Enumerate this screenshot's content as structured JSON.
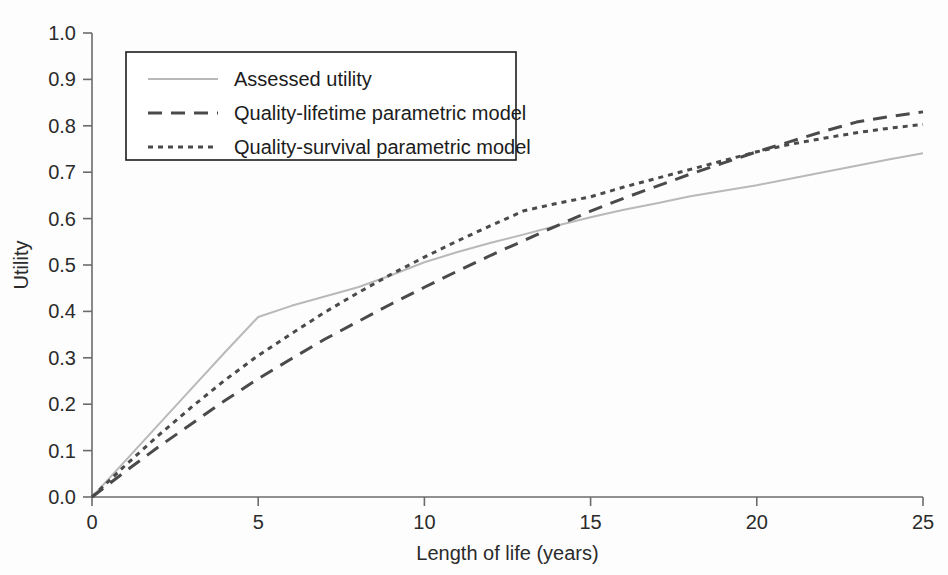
{
  "figure": {
    "background_color": "#fdfdfd"
  },
  "chart_data": {
    "type": "line",
    "title": "",
    "subtitle": "",
    "xlabel": "Length of life (years)",
    "ylabel": "Utility",
    "xlim": [
      0,
      25
    ],
    "ylim": [
      0.0,
      1.0
    ],
    "xticks": [
      0,
      5,
      10,
      15,
      20,
      25
    ],
    "xtick_labels": [
      "0",
      "5",
      "10",
      "15",
      "20",
      "25"
    ],
    "yticks": [
      0.0,
      0.1,
      0.2,
      0.3,
      0.4,
      0.5,
      0.6,
      0.7,
      0.8,
      0.9,
      1.0
    ],
    "ytick_labels": [
      "0.0",
      "0.1",
      "0.2",
      "0.3",
      "0.4",
      "0.5",
      "0.6",
      "0.7",
      "0.8",
      "0.9",
      "1.0"
    ],
    "grid": false,
    "legend_position": "upper-left",
    "series": [
      {
        "name": "Assessed utility",
        "style": "solid",
        "color": "#b9b9b9",
        "width": 2.0,
        "dash": "",
        "x": [
          0,
          1,
          2,
          3,
          4,
          5,
          6,
          7,
          8,
          9,
          10,
          11,
          12,
          13,
          14,
          15,
          16,
          17,
          18,
          19,
          20,
          21,
          22,
          23,
          24,
          25
        ],
        "y": [
          0.0,
          0.078,
          0.156,
          0.234,
          0.312,
          0.388,
          0.412,
          0.432,
          0.452,
          0.478,
          0.506,
          0.528,
          0.548,
          0.566,
          0.585,
          0.603,
          0.619,
          0.633,
          0.648,
          0.66,
          0.672,
          0.686,
          0.7,
          0.714,
          0.728,
          0.741
        ]
      },
      {
        "name": "Quality-lifetime parametric model",
        "style": "dashed",
        "color": "#4a4a4a",
        "width": 3.0,
        "dash": "14 9",
        "x": [
          0,
          1,
          2,
          3,
          4,
          5,
          6,
          7,
          8,
          9,
          10,
          11,
          12,
          13,
          14,
          15,
          16,
          17,
          18,
          19,
          20,
          21,
          22,
          23,
          24,
          25
        ],
        "y": [
          0.0,
          0.055,
          0.108,
          0.158,
          0.208,
          0.255,
          0.298,
          0.34,
          0.378,
          0.416,
          0.452,
          0.487,
          0.521,
          0.553,
          0.585,
          0.616,
          0.644,
          0.67,
          0.696,
          0.72,
          0.744,
          0.766,
          0.788,
          0.808,
          0.82,
          0.83
        ]
      },
      {
        "name": "Quality-survival parametric model",
        "style": "dotted",
        "color": "#4a4a4a",
        "width": 3.0,
        "dash": "5 5",
        "x": [
          0,
          1,
          2,
          3,
          4,
          5,
          6,
          7,
          8,
          9,
          10,
          11,
          12,
          13,
          14,
          15,
          16,
          17,
          18,
          19,
          20,
          21,
          22,
          23,
          24,
          25
        ],
        "y": [
          0.0,
          0.068,
          0.133,
          0.194,
          0.252,
          0.305,
          0.352,
          0.398,
          0.44,
          0.48,
          0.517,
          0.552,
          0.585,
          0.617,
          0.633,
          0.647,
          0.668,
          0.687,
          0.706,
          0.725,
          0.744,
          0.76,
          0.773,
          0.785,
          0.795,
          0.803
        ]
      }
    ]
  },
  "legend": {
    "entries": [
      {
        "label": "Assessed utility"
      },
      {
        "label": "Quality-lifetime parametric model"
      },
      {
        "label": "Quality-survival parametric model"
      }
    ]
  }
}
